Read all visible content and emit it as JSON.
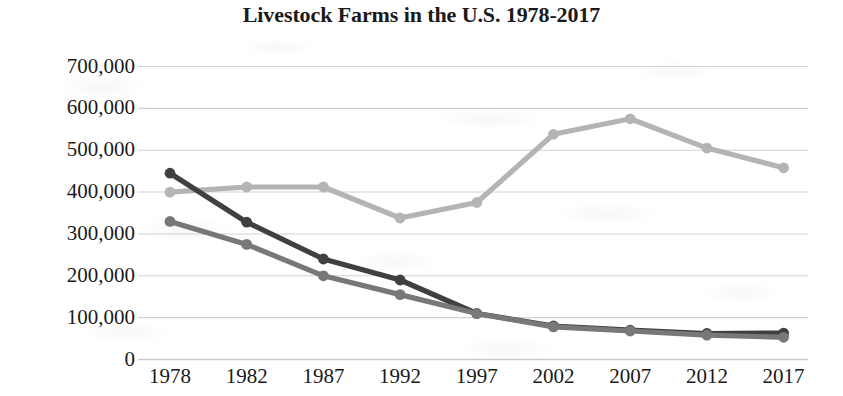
{
  "title": "Livestock Farms in the U.S. 1978-2017",
  "chart_data": {
    "type": "line",
    "title": "Livestock Farms in the U.S. 1978-2017",
    "xlabel": "",
    "ylabel": "",
    "categories": [
      "1978",
      "1982",
      "1987",
      "1992",
      "1997",
      "2002",
      "2007",
      "2012",
      "2017"
    ],
    "ylim": [
      0,
      700000
    ],
    "ytick_labels": [
      "700,000",
      "600,000",
      "500,000",
      "400,000",
      "300,000",
      "200,000",
      "100,000",
      "0"
    ],
    "ytick_values": [
      700000,
      600000,
      500000,
      400000,
      300000,
      200000,
      100000,
      0
    ],
    "grid": true,
    "legend": "none",
    "series": [
      {
        "name": "series-light-gray",
        "color": "#b4b4b4",
        "values": [
          400000,
          412000,
          412000,
          338000,
          375000,
          538000,
          575000,
          505000,
          458000
        ]
      },
      {
        "name": "series-dark",
        "color": "#404040",
        "values": [
          445000,
          328000,
          240000,
          190000,
          110000,
          80000,
          70000,
          62000,
          63000
        ]
      },
      {
        "name": "series-medium-gray",
        "color": "#787878",
        "values": [
          330000,
          275000,
          200000,
          155000,
          110000,
          78000,
          68000,
          58000,
          53000
        ]
      }
    ]
  },
  "axis": {
    "baseline_color": "#c8c8c8",
    "grid_color": "#d2d2d2"
  }
}
